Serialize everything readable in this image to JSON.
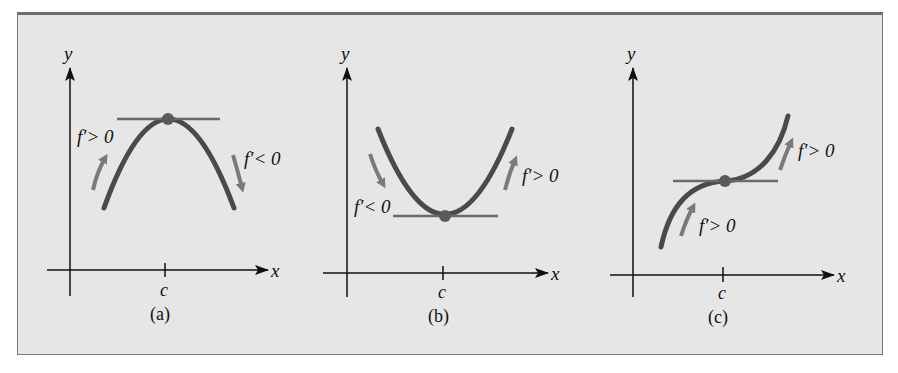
{
  "figure": {
    "panels": [
      {
        "id": "a",
        "caption": "(a)",
        "x_axis_label": "x",
        "y_axis_label": "y",
        "tick_label": "c",
        "curve": "concave-down parabola with local maximum at c",
        "annotations": [
          {
            "text": "f′> 0",
            "side": "left",
            "arrow": "up"
          },
          {
            "text": "f′< 0",
            "side": "right",
            "arrow": "down"
          }
        ]
      },
      {
        "id": "b",
        "caption": "(b)",
        "x_axis_label": "x",
        "y_axis_label": "y",
        "tick_label": "c",
        "curve": "concave-up parabola with local minimum at c",
        "annotations": [
          {
            "text": "f′< 0",
            "side": "left",
            "arrow": "down"
          },
          {
            "text": "f′> 0",
            "side": "right",
            "arrow": "up"
          }
        ]
      },
      {
        "id": "c",
        "caption": "(c)",
        "x_axis_label": "x",
        "y_axis_label": "y",
        "tick_label": "c",
        "curve": "cubic with horizontal tangent (inflection) at c",
        "annotations": [
          {
            "text": "f′> 0",
            "side": "right-lower",
            "arrow": "up"
          },
          {
            "text": "f′> 0",
            "side": "right-upper",
            "arrow": "up"
          }
        ]
      }
    ],
    "colors": {
      "background": "#e6e6e6",
      "frame": "#6e6e6e",
      "axes": "#111111",
      "curve": "#4a4a4a",
      "tangent": "#6a6a6a",
      "point": "#5a5a5a",
      "arrow": "#7a7a7a"
    }
  }
}
